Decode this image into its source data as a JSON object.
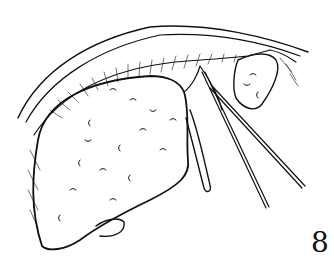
{
  "figure": {
    "number": "8",
    "style": "black ink line drawing on white",
    "colors": {
      "ink": "#111111",
      "background": "#ffffff"
    }
  }
}
